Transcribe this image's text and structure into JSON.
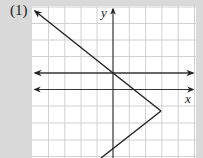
{
  "problem_label": "(1)",
  "axes": {
    "x_label": "x",
    "y_label": "y"
  },
  "colors": {
    "background": "#d9d9d9",
    "grid_bg": "#ffffff",
    "grid_line": "#d0d0d0",
    "ink": "#222222"
  },
  "grid": {
    "left": 32,
    "top": 6,
    "right": 196,
    "bottom": 158,
    "cell": 16.3
  },
  "figure": {
    "horizontal_line_1": "upper double-arrow line through origin",
    "horizontal_line_2": "x-axis, double-arrow",
    "piecewise_graph": "line from upper-left arrow through origin to vertex, then down-left"
  }
}
